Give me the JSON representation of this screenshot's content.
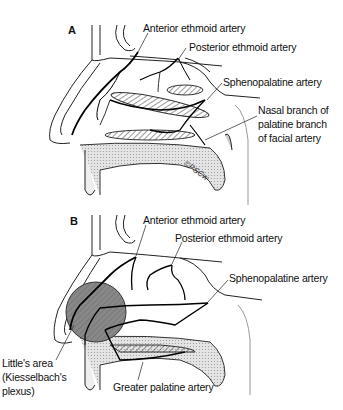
{
  "panel_a": {
    "letter": "A",
    "labels": {
      "anterior_ethmoid": "Anterior ethmoid artery",
      "posterior_ethmoid": "Posterior ethmoid artery",
      "sphenopalatine": "Sphenopalatine artery",
      "nasal_branch_1": "Nasal branch of",
      "nasal_branch_2": "palatine branch",
      "nasal_branch_3": "of facial artery"
    },
    "signature": "©PSCw"
  },
  "panel_b": {
    "letter": "B",
    "labels": {
      "anterior_ethmoid": "Anterior ethmoid artery",
      "posterior_ethmoid": "Posterior ethmoid artery",
      "sphenopalatine": "Sphenopalatine artery",
      "littles_1": "Little's area",
      "littles_2": "(Kiesselbach's",
      "littles_3": "plexus)",
      "greater_palatine": "Greater palatine artery"
    }
  }
}
